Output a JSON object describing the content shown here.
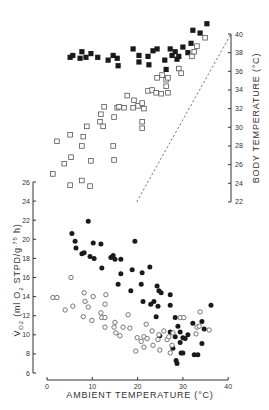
{
  "chart_data": [
    {
      "type": "scatter",
      "title": "",
      "xlabel": "AMBIENT TEMPERATURE (°C)",
      "ylabel": "BODY TEMPERATURE (°C)",
      "ylabel_position": "right",
      "xlim": [
        0,
        40
      ],
      "ylim": [
        22,
        40
      ],
      "yticks": [
        22,
        24,
        26,
        28,
        30,
        32,
        34,
        36,
        38,
        40
      ],
      "grid": false,
      "legend": "none",
      "reference_line": {
        "label": "Tb = Ta",
        "style": "dashed",
        "from": [
          22,
          22
        ],
        "to": [
          40,
          40
        ]
      },
      "series": [
        {
          "name": "filled squares",
          "marker": "filled-square",
          "points": [
            [
              5.1,
              37.5
            ],
            [
              5.7,
              37.7
            ],
            [
              7.3,
              37.4
            ],
            [
              7.7,
              38.1
            ],
            [
              8.6,
              37.5
            ],
            [
              9.7,
              37.9
            ],
            [
              11.2,
              37.5
            ],
            [
              13.5,
              37.2
            ],
            [
              14.6,
              37.7
            ],
            [
              15.5,
              37.4
            ],
            [
              15.7,
              36.6
            ],
            [
              19.0,
              38.4
            ],
            [
              20.3,
              37.7
            ],
            [
              20.3,
              37.0
            ],
            [
              22.3,
              37.6
            ],
            [
              22.5,
              36.7
            ],
            [
              23.4,
              38.2
            ],
            [
              24.3,
              38.4
            ],
            [
              26.0,
              37.2
            ],
            [
              26.3,
              36.2
            ],
            [
              27.2,
              38.4
            ],
            [
              27.6,
              37.7
            ],
            [
              28.3,
              38.1
            ],
            [
              28.7,
              37.3
            ],
            [
              29.1,
              37.6
            ],
            [
              30.0,
              38.6
            ],
            [
              31.1,
              38.0
            ],
            [
              31.8,
              39.0
            ],
            [
              32.2,
              40.4
            ],
            [
              33.8,
              40.1
            ],
            [
              35.3,
              41.1
            ]
          ]
        },
        {
          "name": "open squares",
          "marker": "open-square",
          "points": [
            [
              1.3,
              25.0
            ],
            [
              2.2,
              28.5
            ],
            [
              3.8,
              26.1
            ],
            [
              5.1,
              29.2
            ],
            [
              5.3,
              26.8
            ],
            [
              5.1,
              23.8
            ],
            [
              7.7,
              24.3
            ],
            [
              7.7,
              28.0
            ],
            [
              8.0,
              29.0
            ],
            [
              8.8,
              30.1
            ],
            [
              9.5,
              23.7
            ],
            [
              9.7,
              26.4
            ],
            [
              11.7,
              30.6
            ],
            [
              11.9,
              31.4
            ],
            [
              12.4,
              30.1
            ],
            [
              12.6,
              32.2
            ],
            [
              14.6,
              28.0
            ],
            [
              14.8,
              31.1
            ],
            [
              14.8,
              26.5
            ],
            [
              15.5,
              32.1
            ],
            [
              15.9,
              32.2
            ],
            [
              17.0,
              32.1
            ],
            [
              17.7,
              33.4
            ],
            [
              19.0,
              32.1
            ],
            [
              19.2,
              32.9
            ],
            [
              20.1,
              32.3
            ],
            [
              21.0,
              32.6
            ],
            [
              21.0,
              30.6
            ],
            [
              21.0,
              29.9
            ],
            [
              21.4,
              32.0
            ],
            [
              22.3,
              33.9
            ],
            [
              23.2,
              34.0
            ],
            [
              24.1,
              33.7
            ],
            [
              24.3,
              35.3
            ],
            [
              25.2,
              33.6
            ],
            [
              25.4,
              35.6
            ],
            [
              26.3,
              34.4
            ],
            [
              26.3,
              35.1
            ],
            [
              26.7,
              33.7
            ],
            [
              26.7,
              35.3
            ],
            [
              29.1,
              36.3
            ],
            [
              29.6,
              35.8
            ],
            [
              32.0,
              37.6
            ],
            [
              32.5,
              38.1
            ],
            [
              33.1,
              38.7
            ],
            [
              34.9,
              39.6
            ]
          ]
        }
      ]
    },
    {
      "type": "scatter",
      "title": "",
      "xlabel": "AMBIENT TEMPERATURE (°C)",
      "ylabel": "V̇O2 (ml O2 STPD/g^.75 h)",
      "xlim": [
        0,
        40
      ],
      "ylim": [
        6,
        26
      ],
      "xticks": [
        0,
        10,
        20,
        30,
        40
      ],
      "yticks": [
        6,
        8,
        10,
        12,
        14,
        16,
        18,
        20,
        22,
        24,
        26
      ],
      "grid": false,
      "legend": "none",
      "series": [
        {
          "name": "filled circles",
          "marker": "filled-circle",
          "points": [
            [
              5.5,
              20.6
            ],
            [
              6.2,
              19.8
            ],
            [
              6.4,
              19.1
            ],
            [
              7.7,
              18.5
            ],
            [
              8.2,
              18.6
            ],
            [
              9.1,
              21.9
            ],
            [
              9.5,
              18.2
            ],
            [
              10.2,
              19.6
            ],
            [
              10.4,
              18.0
            ],
            [
              11.9,
              19.5
            ],
            [
              12.1,
              17.0
            ],
            [
              14.1,
              18.1
            ],
            [
              14.6,
              18.3
            ],
            [
              15.0,
              17.9
            ],
            [
              15.7,
              15.3
            ],
            [
              16.3,
              17.9
            ],
            [
              16.3,
              16.4
            ],
            [
              18.5,
              14.6
            ],
            [
              18.8,
              16.8
            ],
            [
              19.4,
              19.8
            ],
            [
              20.8,
              15.3
            ],
            [
              21.0,
              16.5
            ],
            [
              21.2,
              13.5
            ],
            [
              22.7,
              17.1
            ],
            [
              22.9,
              13.2
            ],
            [
              23.6,
              13.5
            ],
            [
              24.1,
              11.9
            ],
            [
              24.3,
              15.1
            ],
            [
              24.5,
              13.0
            ],
            [
              24.7,
              14.6
            ],
            [
              24.9,
              9.9
            ],
            [
              25.2,
              14.4
            ],
            [
              27.2,
              14.2
            ],
            [
              27.2,
              13.1
            ],
            [
              27.2,
              10.3
            ],
            [
              27.8,
              8.6
            ],
            [
              28.3,
              11.8
            ],
            [
              28.3,
              9.8
            ],
            [
              28.5,
              7.3
            ],
            [
              28.7,
              7.0
            ],
            [
              28.9,
              10.9
            ],
            [
              29.4,
              10.3
            ],
            [
              29.4,
              9.2
            ],
            [
              29.6,
              8.1
            ],
            [
              30.0,
              9.7
            ],
            [
              30.0,
              8.1
            ],
            [
              30.5,
              9.6
            ],
            [
              31.1,
              10.0
            ],
            [
              32.2,
              11.2
            ],
            [
              32.5,
              7.9
            ],
            [
              33.3,
              7.9
            ],
            [
              34.2,
              9.1
            ],
            [
              34.2,
              11.4
            ],
            [
              34.7,
              10.6
            ],
            [
              36.2,
              13.1
            ]
          ]
        },
        {
          "name": "open circles",
          "marker": "open-circle",
          "points": [
            [
              1.3,
              13.9
            ],
            [
              2.2,
              13.9
            ],
            [
              4.0,
              12.6
            ],
            [
              5.3,
              16.0
            ],
            [
              5.7,
              13.0
            ],
            [
              8.0,
              11.9
            ],
            [
              8.2,
              14.4
            ],
            [
              8.4,
              13.5
            ],
            [
              9.1,
              12.9
            ],
            [
              9.9,
              11.5
            ],
            [
              10.2,
              14.0
            ],
            [
              11.9,
              12.3
            ],
            [
              12.1,
              11.8
            ],
            [
              12.8,
              11.8
            ],
            [
              12.8,
              13.2
            ],
            [
              13.0,
              14.2
            ],
            [
              12.8,
              10.8
            ],
            [
              14.8,
              10.8
            ],
            [
              15.0,
              11.3
            ],
            [
              15.2,
              10.2
            ],
            [
              16.1,
              9.9
            ],
            [
              16.8,
              10.8
            ],
            [
              17.9,
              12.1
            ],
            [
              18.3,
              10.7
            ],
            [
              19.6,
              8.3
            ],
            [
              19.9,
              9.7
            ],
            [
              20.8,
              9.3
            ],
            [
              21.4,
              9.8
            ],
            [
              21.9,
              11.1
            ],
            [
              22.1,
              9.6
            ],
            [
              21.4,
              8.7
            ],
            [
              23.4,
              8.9
            ],
            [
              23.2,
              10.4
            ],
            [
              24.7,
              10.0
            ],
            [
              24.5,
              9.5
            ],
            [
              24.9,
              8.4
            ],
            [
              25.8,
              10.4
            ],
            [
              26.5,
              9.5
            ],
            [
              26.9,
              9.8
            ],
            [
              27.2,
              8.1
            ],
            [
              27.6,
              8.9
            ],
            [
              27.8,
              10.2
            ],
            [
              29.4,
              11.8
            ],
            [
              30.2,
              11.8
            ],
            [
              32.9,
              10.1
            ],
            [
              33.1,
              10.8
            ],
            [
              33.6,
              10.9
            ],
            [
              33.8,
              12.4
            ],
            [
              35.8,
              10.5
            ]
          ]
        }
      ]
    }
  ],
  "axes": {
    "x_title": "AMBIENT TEMPERATURE (°C)",
    "x_ticks": [
      "0",
      "10",
      "20",
      "30",
      "40"
    ],
    "body_temp_title": "BODY TEMPERATURE (°C)",
    "body_temp_ticks": [
      "22",
      "24",
      "26",
      "28",
      "30",
      "32",
      "34",
      "36",
      "38",
      "40"
    ],
    "vo2_title_main": "(ml O",
    "vo2_title_rest": " STPD/g",
    "vo2_title_exp": ".75",
    "vo2_title_end": " h)",
    "vo2_symbol": "V̇",
    "vo2_symbol_sub": "O2",
    "vo2_sub_2": "2",
    "vo2_ticks": [
      "6",
      "8",
      "10",
      "12",
      "14",
      "16",
      "18",
      "20",
      "22",
      "24",
      "26"
    ]
  },
  "colors": {
    "ink": "#1a1a1a",
    "axis": "#333333",
    "open_marker_stroke": "#555555",
    "background": "#ffffff"
  }
}
